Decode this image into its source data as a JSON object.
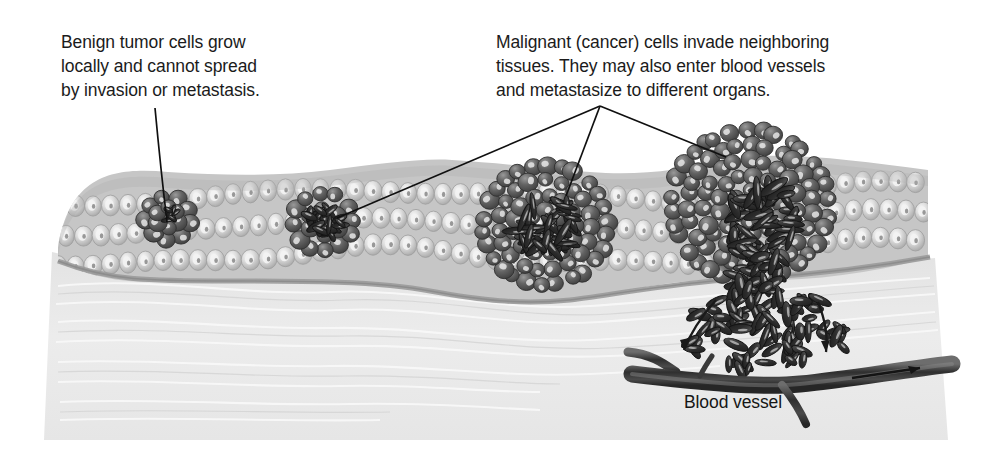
{
  "figure": {
    "width": 983,
    "height": 460,
    "background_color": "#ffffff"
  },
  "captions": {
    "benign": "Benign tumor cells grow\nlocally and cannot spread\nby invasion or metastasis.",
    "malignant": "Malignant (cancer) cells invade neighboring\ntissues. They may also enter blood vessels\nand metastasize to different organs."
  },
  "labels": {
    "blood_vessel": "Blood vessel"
  },
  "colors": {
    "page_background": "#ffffff",
    "text": "#1b1b1b",
    "leader_line": "#101010",
    "epithelium_cell": "#b9b9b9",
    "epithelium_cell_highlight": "#f2f2f2",
    "epithelium_cell_nucleus": "#8e8e8e",
    "epithelium_shadow": "#9a9a9a",
    "basement_membrane": "#9c9c9c",
    "stroma": "#e8e8e8",
    "stroma_fiber": "#f7f7f7",
    "tumor_cell_dark": "#5a5a5a",
    "tumor_cell_highlight": "#e4e4e4",
    "invading_cell": "#3a3a3a",
    "blood_vessel": "#3c3c3c",
    "arrow": "#1a1a1a"
  },
  "structures": [
    {
      "name": "epithelium",
      "description": "Three rows of light gray rounded epithelial cells forming the surface tissue layer",
      "rows": 3,
      "x_start": 58,
      "x_end": 928
    },
    {
      "name": "basement-membrane",
      "description": "Gray boundary line beneath the epithelium separating it from the stroma"
    },
    {
      "name": "stroma",
      "description": "Light gray connective tissue with wavy collagen fibers below the basement membrane"
    }
  ],
  "tumors": [
    {
      "id": "benign-small",
      "label": "benign tumor cluster",
      "type": "benign",
      "cx": 168,
      "cy": 218,
      "radius": 22,
      "description": "Small dark cluster of benign tumor cells confined within the epithelium"
    },
    {
      "id": "benign-elongated",
      "label": "benign tumor with elongated cells",
      "type": "benign",
      "cx": 323,
      "cy": 222,
      "radius": 30,
      "description": "Cluster of dark elongated tumor cells still contained within the epithelium"
    },
    {
      "id": "malignant-contained",
      "label": "malignant tumor expanding epithelium",
      "type": "malignant",
      "cx": 545,
      "cy": 225,
      "radius": 62,
      "description": "Round malignant mass bulging the epithelium with elongated cells at its core"
    },
    {
      "id": "malignant-invading",
      "label": "malignant tumor invading stroma",
      "type": "malignant",
      "cx": 750,
      "cy": 205,
      "radius": 78,
      "description": "Large malignant mass that breaks through the basement membrane, with cells streaming into the stroma toward the blood vessel"
    }
  ],
  "leader_lines": [
    {
      "name": "benign-leader",
      "from": [
        155,
        108
      ],
      "to": [
        168,
        222
      ],
      "description": "Line from the benign caption to the small benign tumor"
    },
    {
      "name": "malignant-leader-vertex",
      "vertex": [
        600,
        106
      ],
      "targets": [
        [
          337,
          218
        ],
        [
          566,
          196
        ],
        [
          726,
          157
        ]
      ],
      "description": "Three lines fanning from the malignant caption to the three malignant-related lesions"
    }
  ],
  "blood_vessel": {
    "name": "blood-vessel",
    "x_start": 628,
    "x_end": 955,
    "y": 370,
    "branches": 3,
    "flow_arrow_direction": "right",
    "description": "Dark branching blood vessel running along the lower stroma; tumor cells enter it"
  },
  "cell_entry_arrows": [
    {
      "name": "arrow-left-curve",
      "direction": "down-left"
    },
    {
      "name": "arrow-right-curve",
      "direction": "down-right"
    },
    {
      "name": "arrow-vessel-flow",
      "direction": "right"
    }
  ]
}
